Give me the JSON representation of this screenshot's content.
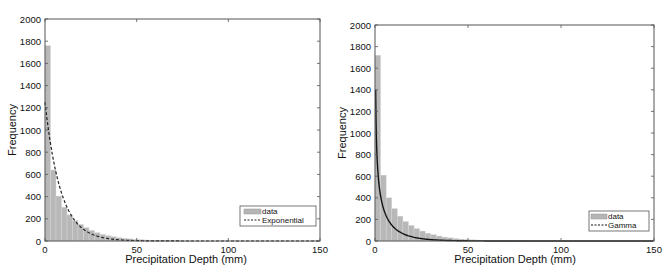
{
  "chart_data": [
    {
      "type": "bar",
      "title": "",
      "xlabel": "Precipitation Depth (mm)",
      "ylabel": "Frequency",
      "xlim": [
        0,
        150
      ],
      "ylim": [
        0,
        2000
      ],
      "xticks": [
        0,
        50,
        100,
        150
      ],
      "yticks": [
        0,
        200,
        400,
        600,
        800,
        1000,
        1200,
        1400,
        1600,
        1800,
        2000
      ],
      "grid": false,
      "legend_position": "lower right",
      "legend": [
        "data",
        "Exponential"
      ],
      "bin_width": 3,
      "bins_start": [
        0,
        3,
        6,
        9,
        12,
        15,
        18,
        21,
        24,
        27,
        30,
        33,
        36,
        39,
        42,
        45,
        48,
        51,
        54,
        57,
        60,
        63,
        66,
        69,
        72,
        75,
        78
      ],
      "values": [
        1760,
        640,
        405,
        305,
        235,
        185,
        150,
        120,
        95,
        75,
        60,
        48,
        38,
        30,
        24,
        19,
        15,
        12,
        9,
        7,
        5,
        4,
        3,
        2,
        2,
        1,
        1
      ],
      "series": [
        {
          "name": "data",
          "kind": "histogram",
          "color": "#b5b5b5"
        },
        {
          "name": "Exponential",
          "kind": "line",
          "style": "dashed",
          "color": "#222222",
          "x": [
            0,
            5,
            10,
            15,
            20,
            25,
            30,
            40,
            50,
            60,
            80,
            100,
            150
          ],
          "values": [
            1250,
            697,
            385,
            215,
            119,
            66,
            37,
            11,
            3,
            1,
            0,
            0,
            0
          ]
        }
      ]
    },
    {
      "type": "bar",
      "title": "",
      "xlabel": "Precipitation Depth (mm)",
      "ylabel": "Frequency",
      "xlim": [
        0,
        150
      ],
      "ylim": [
        0,
        2000
      ],
      "xticks": [
        0,
        50,
        100,
        150
      ],
      "yticks": [
        0,
        200,
        400,
        600,
        800,
        1000,
        1200,
        1400,
        1600,
        1800,
        2000
      ],
      "grid": false,
      "legend_position": "lower right",
      "legend": [
        "data",
        "Gamma"
      ],
      "bin_width": 3,
      "bins_start": [
        0,
        3,
        6,
        9,
        12,
        15,
        18,
        21,
        24,
        27,
        30,
        33,
        36,
        39,
        42,
        45,
        48,
        51,
        54,
        57,
        60,
        63,
        66,
        69,
        72,
        75,
        78
      ],
      "values": [
        1720,
        610,
        400,
        300,
        230,
        180,
        145,
        115,
        92,
        72,
        58,
        46,
        36,
        29,
        23,
        18,
        14,
        11,
        9,
        7,
        5,
        4,
        3,
        2,
        2,
        1,
        1
      ],
      "series": [
        {
          "name": "data",
          "kind": "histogram",
          "color": "#b5b5b5"
        },
        {
          "name": "Gamma",
          "kind": "line",
          "style": "solid",
          "color": "#111111",
          "x": [
            0.5,
            1,
            2,
            5,
            10,
            15,
            20,
            30,
            40,
            50,
            60,
            80,
            150
          ],
          "values": [
            2000,
            1500,
            1050,
            560,
            300,
            180,
            115,
            50,
            22,
            10,
            5,
            1,
            0
          ]
        }
      ]
    }
  ],
  "charts": [
    {
      "ylabel": "Frequency",
      "xlabel": "Precipitation Depth (mm)",
      "yticklabels": [
        "0",
        "200",
        "400",
        "600",
        "800",
        "1000",
        "1200",
        "1400",
        "1600",
        "1800",
        "2000"
      ],
      "xticklabels": [
        "0",
        "50",
        "100",
        "150"
      ],
      "legend": {
        "data_label": "data",
        "fit_label": "Exponential"
      }
    },
    {
      "ylabel": "Frequency",
      "xlabel": "Precipitation Depth (mm)",
      "yticklabels": [
        "0",
        "200",
        "400",
        "600",
        "800",
        "1000",
        "1200",
        "1400",
        "1600",
        "1800",
        "2000"
      ],
      "xticklabels": [
        "0",
        "50",
        "100",
        "150"
      ],
      "legend": {
        "data_label": "data",
        "fit_label": "Gamma"
      }
    }
  ]
}
